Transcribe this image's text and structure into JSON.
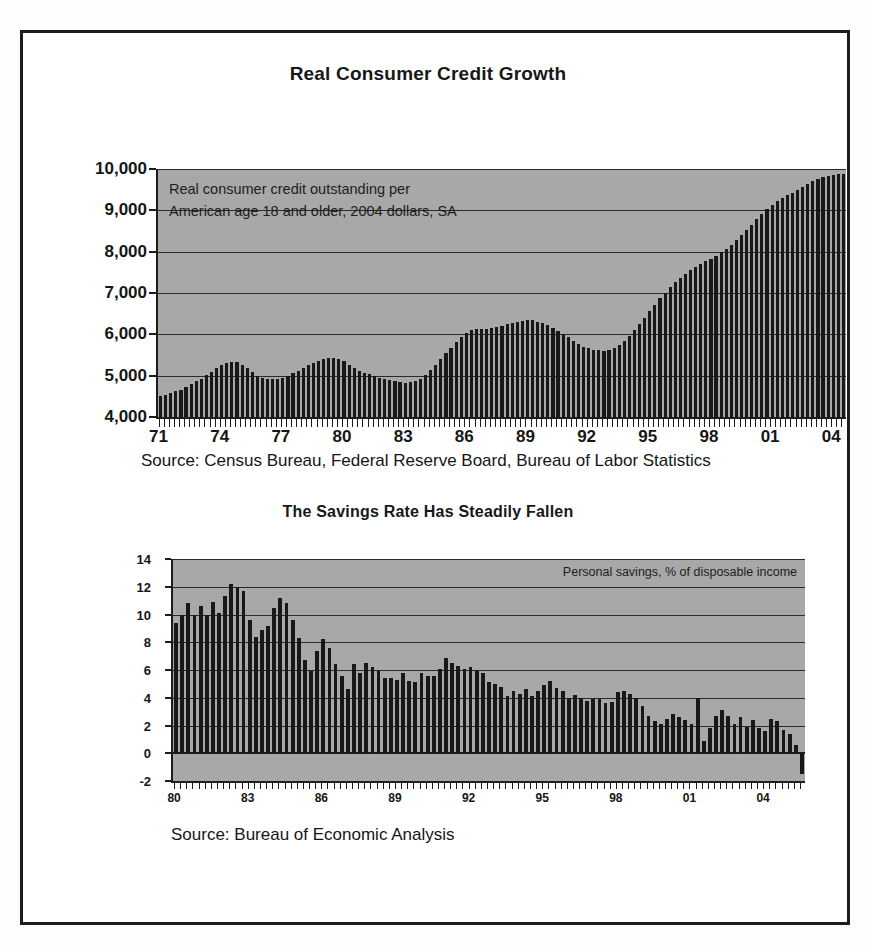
{
  "charts": [
    {
      "id": "real-consumer-credit-growth",
      "title": "Real Consumer Credit Growth",
      "annotation_line1": "Real consumer credit outstanding per",
      "annotation_line2": "American age 18 and older, 2004 dollars, SA",
      "source": "Source: Census Bureau, Federal Reserve Board, Bureau of Labor Statistics",
      "yticks": [
        "10,000",
        "9,000",
        "8,000",
        "7,000",
        "6,000",
        "5,000",
        "4,000"
      ],
      "xticks": [
        "71",
        "74",
        "77",
        "80",
        "83",
        "86",
        "89",
        "92",
        "95",
        "98",
        "01",
        "04"
      ],
      "plot_bg": "#a8a8a8",
      "bar_color": "#181818"
    },
    {
      "id": "savings-rate-has-steadily-fallen",
      "title": "The Savings Rate Has Steadily Fallen",
      "annotation_line1": "Personal savings, % of disposable income",
      "source": "Source: Bureau of Economic Analysis",
      "yticks": [
        "14",
        "12",
        "10",
        "8",
        "6",
        "4",
        "2",
        "0",
        "-2"
      ],
      "xticks": [
        "80",
        "83",
        "86",
        "89",
        "92",
        "95",
        "98",
        "01",
        "04"
      ],
      "plot_bg": "#a8a8a8",
      "bar_color": "#181818"
    }
  ],
  "chart_data": [
    {
      "type": "bar",
      "title": "Real Consumer Credit Growth",
      "subtitle": "Real consumer credit outstanding per American age 18 and older, 2004 dollars, SA",
      "xlabel": "",
      "ylabel": "2004 dollars per American age 18+",
      "ylim": [
        4000,
        10000
      ],
      "ytick_values": [
        4000,
        5000,
        6000,
        7000,
        8000,
        9000,
        10000
      ],
      "xtick_labels": [
        "71",
        "74",
        "77",
        "80",
        "83",
        "86",
        "89",
        "92",
        "95",
        "98",
        "01",
        "04"
      ],
      "grid": true,
      "legend": "none",
      "source": "Source: Census Bureau, Federal Reserve Board, Bureau of Labor Statistics",
      "x_frequency": "quarterly",
      "x_start": "1971 Q1",
      "x_end": "2005 Q1",
      "x": [
        "1971Q1",
        "1971Q2",
        "1971Q3",
        "1971Q4",
        "1972Q1",
        "1972Q2",
        "1972Q3",
        "1972Q4",
        "1973Q1",
        "1973Q2",
        "1973Q3",
        "1973Q4",
        "1974Q1",
        "1974Q2",
        "1974Q3",
        "1974Q4",
        "1975Q1",
        "1975Q2",
        "1975Q3",
        "1975Q4",
        "1976Q1",
        "1976Q2",
        "1976Q3",
        "1976Q4",
        "1977Q1",
        "1977Q2",
        "1977Q3",
        "1977Q4",
        "1978Q1",
        "1978Q2",
        "1978Q3",
        "1978Q4",
        "1979Q1",
        "1979Q2",
        "1979Q3",
        "1979Q4",
        "1980Q1",
        "1980Q2",
        "1980Q3",
        "1980Q4",
        "1981Q1",
        "1981Q2",
        "1981Q3",
        "1981Q4",
        "1982Q1",
        "1982Q2",
        "1982Q3",
        "1982Q4",
        "1983Q1",
        "1983Q2",
        "1983Q3",
        "1983Q4",
        "1984Q1",
        "1984Q2",
        "1984Q3",
        "1984Q4",
        "1985Q1",
        "1985Q2",
        "1985Q3",
        "1985Q4",
        "1986Q1",
        "1986Q2",
        "1986Q3",
        "1986Q4",
        "1987Q1",
        "1987Q2",
        "1987Q3",
        "1987Q4",
        "1988Q1",
        "1988Q2",
        "1988Q3",
        "1988Q4",
        "1989Q1",
        "1989Q2",
        "1989Q3",
        "1989Q4",
        "1990Q1",
        "1990Q2",
        "1990Q3",
        "1990Q4",
        "1991Q1",
        "1991Q2",
        "1991Q3",
        "1991Q4",
        "1992Q1",
        "1992Q2",
        "1992Q3",
        "1992Q4",
        "1993Q1",
        "1993Q2",
        "1993Q3",
        "1993Q4",
        "1994Q1",
        "1994Q2",
        "1994Q3",
        "1994Q4",
        "1995Q1",
        "1995Q2",
        "1995Q3",
        "1995Q4",
        "1996Q1",
        "1996Q2",
        "1996Q3",
        "1996Q4",
        "1997Q1",
        "1997Q2",
        "1997Q3",
        "1997Q4",
        "1998Q1",
        "1998Q2",
        "1998Q3",
        "1998Q4",
        "1999Q1",
        "1999Q2",
        "1999Q3",
        "1999Q4",
        "2000Q1",
        "2000Q2",
        "2000Q3",
        "2000Q4",
        "2001Q1",
        "2001Q2",
        "2001Q3",
        "2001Q4",
        "2002Q1",
        "2002Q2",
        "2002Q3",
        "2002Q4",
        "2003Q1",
        "2003Q2",
        "2003Q3",
        "2003Q4",
        "2004Q1",
        "2004Q2",
        "2004Q3",
        "2004Q4",
        "2005Q1"
      ],
      "values": [
        4500,
        4540,
        4580,
        4620,
        4660,
        4720,
        4790,
        4860,
        4930,
        5010,
        5100,
        5180,
        5250,
        5300,
        5330,
        5320,
        5270,
        5180,
        5080,
        5000,
        4950,
        4920,
        4910,
        4920,
        4950,
        5000,
        5060,
        5120,
        5180,
        5250,
        5310,
        5360,
        5400,
        5420,
        5420,
        5400,
        5350,
        5270,
        5180,
        5110,
        5060,
        5030,
        4990,
        4950,
        4920,
        4890,
        4860,
        4840,
        4830,
        4840,
        4870,
        4930,
        5020,
        5130,
        5260,
        5400,
        5540,
        5680,
        5810,
        5930,
        6030,
        6100,
        6130,
        6140,
        6140,
        6150,
        6180,
        6210,
        6240,
        6270,
        6300,
        6330,
        6350,
        6340,
        6310,
        6270,
        6220,
        6160,
        6090,
        6010,
        5930,
        5840,
        5760,
        5700,
        5660,
        5630,
        5610,
        5600,
        5620,
        5670,
        5740,
        5840,
        5960,
        6100,
        6250,
        6400,
        6560,
        6720,
        6870,
        7010,
        7140,
        7260,
        7370,
        7470,
        7560,
        7640,
        7710,
        7770,
        7830,
        7900,
        7980,
        8070,
        8170,
        8280,
        8400,
        8520,
        8650,
        8780,
        8910,
        9030,
        9140,
        9230,
        9300,
        9360,
        9430,
        9500,
        9570,
        9640,
        9700,
        9750,
        9800,
        9830,
        9860,
        9870,
        9880
      ],
      "note": "Values estimated from bar heights; quarterly series rising from ~4,500 in 1971 to ~9,880 in early 2005 with cyclical dips around 1975-76, 1982-83 and 1992-93."
    },
    {
      "type": "bar",
      "title": "The Savings Rate Has Steadily Fallen",
      "subtitle": "Personal savings, % of disposable income",
      "xlabel": "",
      "ylabel": "Percent of disposable income",
      "ylim": [
        -2,
        14
      ],
      "ytick_values": [
        -2,
        0,
        2,
        4,
        6,
        8,
        10,
        12,
        14
      ],
      "xtick_labels": [
        "80",
        "83",
        "86",
        "89",
        "92",
        "95",
        "98",
        "01",
        "04"
      ],
      "grid": true,
      "legend": "none",
      "source": "Source: Bureau of Economic Analysis",
      "x_frequency": "quarterly",
      "x_start": "1980 Q1",
      "x_end": "2005 Q3",
      "x": [
        "1980Q1",
        "1980Q2",
        "1980Q3",
        "1980Q4",
        "1981Q1",
        "1981Q2",
        "1981Q3",
        "1981Q4",
        "1982Q1",
        "1982Q2",
        "1982Q3",
        "1982Q4",
        "1983Q1",
        "1983Q2",
        "1983Q3",
        "1983Q4",
        "1984Q1",
        "1984Q2",
        "1984Q3",
        "1984Q4",
        "1985Q1",
        "1985Q2",
        "1985Q3",
        "1985Q4",
        "1986Q1",
        "1986Q2",
        "1986Q3",
        "1986Q4",
        "1987Q1",
        "1987Q2",
        "1987Q3",
        "1987Q4",
        "1988Q1",
        "1988Q2",
        "1988Q3",
        "1988Q4",
        "1989Q1",
        "1989Q2",
        "1989Q3",
        "1989Q4",
        "1990Q1",
        "1990Q2",
        "1990Q3",
        "1990Q4",
        "1991Q1",
        "1991Q2",
        "1991Q3",
        "1991Q4",
        "1992Q1",
        "1992Q2",
        "1992Q3",
        "1992Q4",
        "1993Q1",
        "1993Q2",
        "1993Q3",
        "1993Q4",
        "1994Q1",
        "1994Q2",
        "1994Q3",
        "1994Q4",
        "1995Q1",
        "1995Q2",
        "1995Q3",
        "1995Q4",
        "1996Q1",
        "1996Q2",
        "1996Q3",
        "1996Q4",
        "1997Q1",
        "1997Q2",
        "1997Q3",
        "1997Q4",
        "1998Q1",
        "1998Q2",
        "1998Q3",
        "1998Q4",
        "1999Q1",
        "1999Q2",
        "1999Q3",
        "1999Q4",
        "2000Q1",
        "2000Q2",
        "2000Q3",
        "2000Q4",
        "2001Q1",
        "2001Q2",
        "2001Q3",
        "2001Q4",
        "2002Q1",
        "2002Q2",
        "2002Q3",
        "2002Q4",
        "2003Q1",
        "2003Q2",
        "2003Q3",
        "2003Q4",
        "2004Q1",
        "2004Q2",
        "2004Q3",
        "2004Q4",
        "2005Q1",
        "2005Q2",
        "2005Q3"
      ],
      "values": [
        9.4,
        10.0,
        10.8,
        10.0,
        10.6,
        10.0,
        10.9,
        10.1,
        11.3,
        12.2,
        12.0,
        11.7,
        9.6,
        8.4,
        8.9,
        9.2,
        10.5,
        11.2,
        10.8,
        9.6,
        8.3,
        6.7,
        5.9,
        7.4,
        8.2,
        7.6,
        6.4,
        5.6,
        4.6,
        6.4,
        5.8,
        6.5,
        6.2,
        5.9,
        5.4,
        5.4,
        5.3,
        5.8,
        5.2,
        5.1,
        5.8,
        5.6,
        5.6,
        6.1,
        6.9,
        6.5,
        6.3,
        6.1,
        6.2,
        5.9,
        5.8,
        5.1,
        5.0,
        4.8,
        4.1,
        4.5,
        4.3,
        4.6,
        4.1,
        4.5,
        4.9,
        5.2,
        4.7,
        4.5,
        4.0,
        4.2,
        4.0,
        3.8,
        3.9,
        3.9,
        3.6,
        3.7,
        4.4,
        4.5,
        4.3,
        4.0,
        3.4,
        2.7,
        2.3,
        2.1,
        2.5,
        2.8,
        2.6,
        2.4,
        2.1,
        4.0,
        0.9,
        1.8,
        2.7,
        3.1,
        2.7,
        2.1,
        2.6,
        1.9,
        2.4,
        1.8,
        1.6,
        2.5,
        2.3,
        1.7,
        1.4,
        0.6,
        -1.5
      ],
      "note": "Personal saving rate estimated from bar heights; falls from ~10-12% in the early 1980s to near zero, with the final bar negative at about -1.5%."
    }
  ]
}
